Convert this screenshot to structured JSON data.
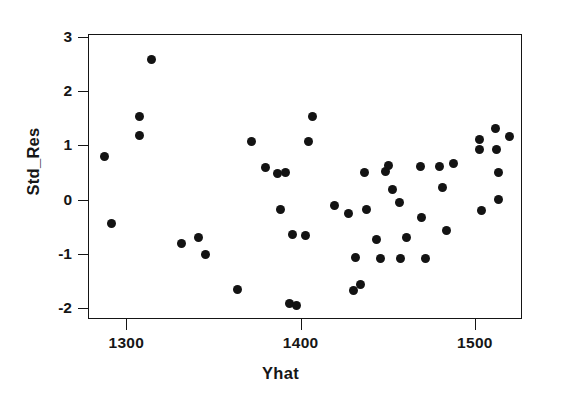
{
  "chart_data": {
    "type": "scatter",
    "title": "",
    "xlabel": "Yhat",
    "ylabel": "Std_Res",
    "xlim": [
      1278,
      1527
    ],
    "ylim": [
      -2.2,
      3.05
    ],
    "xticks": [
      1300,
      1400,
      1500
    ],
    "xtick_labels": [
      "1300",
      "1400",
      "1500"
    ],
    "yticks": [
      -2,
      -1,
      0,
      1,
      2,
      3
    ],
    "ytick_labels": [
      "-2",
      "-1",
      "0",
      "1",
      "2",
      "3"
    ],
    "grid": false,
    "legend": null,
    "marker": "filled-circle",
    "marker_color": "#131313",
    "points": [
      {
        "x": 1287,
        "y": 0.82
      },
      {
        "x": 1291,
        "y": -0.42
      },
      {
        "x": 1307,
        "y": 1.55
      },
      {
        "x": 1307,
        "y": 1.19
      },
      {
        "x": 1314,
        "y": 2.59
      },
      {
        "x": 1331,
        "y": -0.79
      },
      {
        "x": 1341,
        "y": -0.68
      },
      {
        "x": 1345,
        "y": -0.99
      },
      {
        "x": 1363,
        "y": -1.64
      },
      {
        "x": 1371,
        "y": 1.09
      },
      {
        "x": 1379,
        "y": 0.61
      },
      {
        "x": 1386,
        "y": 0.49
      },
      {
        "x": 1391,
        "y": 0.52
      },
      {
        "x": 1388,
        "y": -0.16
      },
      {
        "x": 1393,
        "y": -1.9
      },
      {
        "x": 1397,
        "y": -1.93
      },
      {
        "x": 1395,
        "y": -0.63
      },
      {
        "x": 1404,
        "y": 1.09
      },
      {
        "x": 1406,
        "y": 1.55
      },
      {
        "x": 1402,
        "y": -0.64
      },
      {
        "x": 1419,
        "y": -0.09
      },
      {
        "x": 1427,
        "y": -0.23
      },
      {
        "x": 1431,
        "y": -1.05
      },
      {
        "x": 1430,
        "y": -1.65
      },
      {
        "x": 1434,
        "y": -1.54
      },
      {
        "x": 1436,
        "y": 0.51
      },
      {
        "x": 1437,
        "y": -0.16
      },
      {
        "x": 1443,
        "y": -0.72
      },
      {
        "x": 1445,
        "y": -1.06
      },
      {
        "x": 1448,
        "y": 0.54
      },
      {
        "x": 1450,
        "y": 0.64
      },
      {
        "x": 1452,
        "y": 0.2
      },
      {
        "x": 1456,
        "y": -0.04
      },
      {
        "x": 1457,
        "y": -1.06
      },
      {
        "x": 1460,
        "y": -0.68
      },
      {
        "x": 1468,
        "y": 0.63
      },
      {
        "x": 1469,
        "y": -0.31
      },
      {
        "x": 1471,
        "y": -1.06
      },
      {
        "x": 1479,
        "y": 0.63
      },
      {
        "x": 1481,
        "y": 0.25
      },
      {
        "x": 1483,
        "y": -0.56
      },
      {
        "x": 1487,
        "y": 0.69
      },
      {
        "x": 1502,
        "y": 1.13
      },
      {
        "x": 1502,
        "y": 0.94
      },
      {
        "x": 1503,
        "y": -0.18
      },
      {
        "x": 1511,
        "y": 1.32
      },
      {
        "x": 1512,
        "y": 0.94
      },
      {
        "x": 1513,
        "y": 0.51
      },
      {
        "x": 1513,
        "y": 0.02
      },
      {
        "x": 1519,
        "y": 1.18
      }
    ]
  },
  "axes": {
    "x_title": "Yhat",
    "y_title": "Std_Res"
  }
}
